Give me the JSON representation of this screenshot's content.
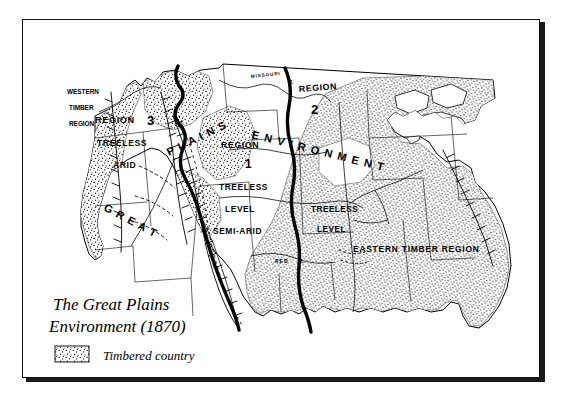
{
  "map": {
    "title_line1": "The Great Plains",
    "title_line2": "Environment (1870)",
    "legend": {
      "swatch_name": "stipple-swatch",
      "label": "Timbered country"
    },
    "arc_text": {
      "great": "G R E A T",
      "plains": "P L A I N S",
      "environment": "E N V I R O N M E N T"
    },
    "regions": [
      {
        "id": "region-3",
        "name_word": "REGION",
        "number": "3",
        "descriptors": [
          "TREELESS",
          "ARID"
        ]
      },
      {
        "id": "region-1",
        "name_word": "REGION",
        "number": "1",
        "descriptors": [
          "TREELESS",
          "LEVEL",
          "SEMI-ARID"
        ]
      },
      {
        "id": "region-2",
        "name_word": "REGION",
        "number": "2",
        "descriptors": []
      }
    ],
    "area_labels": [
      {
        "id": "western-timber-region",
        "lines": [
          "WESTERN",
          "TIMBER",
          "REGION"
        ]
      },
      {
        "id": "eastern-timber-region",
        "text": "EASTERN  TIMBER   REGION"
      },
      {
        "id": "treeless-level-east",
        "lines": [
          "TREELESS",
          "LEVEL"
        ]
      }
    ],
    "rivers": [
      {
        "id": "missouri-river",
        "label": "MISSOURI",
        "suffix": "R."
      },
      {
        "id": "red-river",
        "label": "RED",
        "suffix": "R."
      }
    ],
    "colors": {
      "ink": "#000000",
      "paper": "#ffffff",
      "stipple": "#2b2b2b"
    }
  }
}
